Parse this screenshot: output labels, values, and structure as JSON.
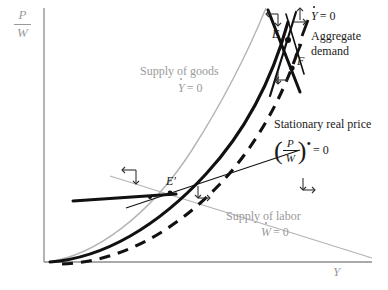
{
  "figure": {
    "type": "phase-diagram",
    "background_color": "#ffffff",
    "axes": {
      "y_axis_label_numerator": "P",
      "y_axis_label_denominator": "W",
      "x_axis_label": "Y",
      "axis_color": "#8c8c8c",
      "x_axis_y_px": 262,
      "y_axis_x_px": 44
    },
    "curves": {
      "supply_of_goods": {
        "label_line1": "Supply of goods",
        "label_line2_symbol": "Y",
        "label_line2_tail": "= 0",
        "color": "#b0b0b0",
        "style": "solid-thin"
      },
      "supply_of_labor": {
        "label_line1": "Supply of labor",
        "label_line2_symbol": "W",
        "label_line2_tail": "= 0",
        "color": "#b0b0b0",
        "style": "solid-thin"
      },
      "aggregate_demand": {
        "label_line1": "Aggregate",
        "label_line2": "demand",
        "label_top_symbol": "Y",
        "label_top_tail": "= 0",
        "color": "#111111",
        "style": "solid-thick"
      },
      "stationary_real_price": {
        "label_line1": "Stationary real price",
        "formula_numerator": "P",
        "formula_denominator": "W",
        "formula_tail": "= 0",
        "color": "#111111",
        "style": "dashed-thick"
      }
    },
    "points": [
      {
        "name": "equilibrium-E",
        "label": "E",
        "x": 283,
        "y": 38
      },
      {
        "name": "point-F",
        "label": "F",
        "x": 298,
        "y": 62
      },
      {
        "name": "equilibrium-E-prime",
        "label": "E",
        "prime": "′",
        "x": 171,
        "y": 182
      }
    ],
    "arrow_markers": [
      {
        "name": "arrow-cross-upper-left",
        "x": 272,
        "y": 14
      },
      {
        "name": "arrow-cross-upper-right",
        "x": 299,
        "y": 12
      },
      {
        "name": "arrow-cross-below-F",
        "x": 282,
        "y": 78
      },
      {
        "name": "arrow-cross-mid-left",
        "x": 128,
        "y": 172
      },
      {
        "name": "arrow-cross-mid-right",
        "x": 303,
        "y": 185
      },
      {
        "name": "arrow-cross-lower-left",
        "x": 201,
        "y": 193
      }
    ]
  }
}
